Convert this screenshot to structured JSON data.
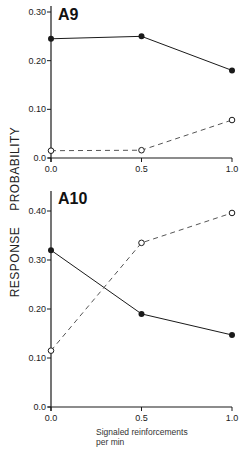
{
  "chart_data": [
    {
      "type": "line",
      "title": "A9",
      "xlabel": "Signaled reinforcements per min",
      "ylabel": "RESPONSE PROBABILITY",
      "x": [
        0.0,
        0.5,
        1.0
      ],
      "x_tick_labels": [
        "0.0",
        "0.5",
        "1.0"
      ],
      "y_tick_labels": [
        "0.0",
        "0.10",
        "0.20",
        "0.30"
      ],
      "y_ticks": [
        0.0,
        0.1,
        0.2,
        0.3
      ],
      "ylim": [
        0.0,
        0.3
      ],
      "grid": false,
      "legend": null,
      "series": [
        {
          "name": "filled circles (solid line)",
          "marker": "filled",
          "line": "solid",
          "values": [
            0.245,
            0.25,
            0.18
          ]
        },
        {
          "name": "open circles (dashed line)",
          "marker": "open",
          "line": "dashed",
          "values": [
            0.015,
            0.016,
            0.078
          ]
        }
      ]
    },
    {
      "type": "line",
      "title": "A10",
      "xlabel": "Signaled reinforcements per min",
      "ylabel": "RESPONSE PROBABILITY",
      "x": [
        0.0,
        0.5,
        1.0
      ],
      "x_tick_labels": [
        "0.0",
        "0.5",
        "1.0"
      ],
      "y_tick_labels": [
        "0.0",
        "0.10",
        "0.20",
        "0.30",
        "0.40"
      ],
      "y_ticks": [
        0.0,
        0.1,
        0.2,
        0.3,
        0.4
      ],
      "ylim": [
        0.0,
        0.4
      ],
      "grid": false,
      "legend": null,
      "series": [
        {
          "name": "filled circles (solid line)",
          "marker": "filled",
          "line": "solid",
          "values": [
            0.32,
            0.19,
            0.147
          ]
        },
        {
          "name": "open circles (dashed line)",
          "marker": "open",
          "line": "dashed",
          "values": [
            0.115,
            0.335,
            0.396
          ]
        }
      ]
    }
  ],
  "labels": {
    "ylabel": "RESPONSE PROBABILITY",
    "xlabel_line1": "Signaled reinforcements",
    "xlabel_line2": "per min",
    "panel_a9": "A9",
    "panel_a10": "A10"
  },
  "colors": {
    "ink": "#1a1a1a",
    "background": "#ffffff"
  }
}
